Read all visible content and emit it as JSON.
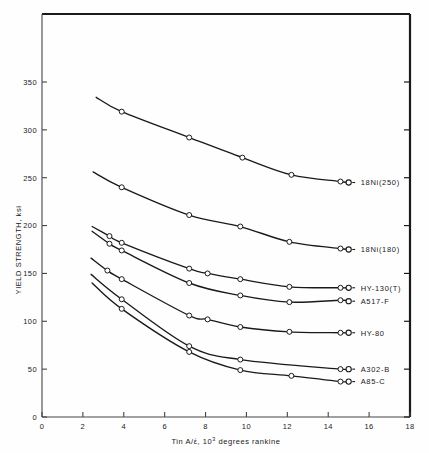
{
  "chart_data": {
    "type": "line",
    "title": "",
    "xlabel": "Tin A/έ, 10³ degrees rankine",
    "ylabel": "YIELD STRENGTH, ksi",
    "xlim": [
      0,
      18
    ],
    "ylim": [
      0,
      375
    ],
    "xticks": [
      0,
      2,
      4,
      6,
      8,
      10,
      12,
      14,
      16,
      18
    ],
    "yticks": [
      0,
      50,
      100,
      150,
      200,
      250,
      300,
      350
    ],
    "xtick_labels": [
      "0",
      "2",
      "4",
      "6",
      "8",
      "10",
      "12",
      "14",
      "16",
      "18"
    ],
    "ytick_labels": [
      "0",
      "50",
      "100",
      "150",
      "200",
      "250",
      "300",
      "350"
    ],
    "grid": false,
    "legend_position": "right-of-curve-ends",
    "marker": "open-circle",
    "line_color": "#1a1a1a",
    "series": [
      {
        "name": "18Ni(250)",
        "label": "18Ni(250)",
        "label_x": 15.6,
        "label_y": 246,
        "curve_start": [
          2.65,
          334
        ],
        "curve_end": [
          15.0,
          245
        ],
        "x": [
          3.9,
          7.2,
          9.8,
          12.2,
          14.6
        ],
        "values": [
          319,
          292,
          271,
          253,
          246
        ]
      },
      {
        "name": "18Ni(180)",
        "label": "18Ni(180)",
        "label_x": 15.6,
        "label_y": 176,
        "curve_start": [
          2.5,
          256
        ],
        "curve_end": [
          15.0,
          175
        ],
        "x": [
          3.9,
          7.2,
          9.7,
          12.1,
          14.6
        ],
        "values": [
          240,
          211,
          199,
          183,
          176
        ]
      },
      {
        "name": "HY-130(T)",
        "label": "HY-130(T)",
        "label_x": 15.6,
        "label_y": 135,
        "curve_start": [
          2.45,
          199
        ],
        "curve_end": [
          15.0,
          135
        ],
        "x": [
          3.3,
          3.9,
          7.2,
          8.1,
          9.7,
          12.1,
          14.6
        ],
        "values": [
          189,
          182,
          155,
          150,
          144,
          136,
          135
        ]
      },
      {
        "name": "A517-F",
        "label": "A517-F",
        "label_x": 15.6,
        "label_y": 121,
        "curve_start": [
          2.45,
          194
        ],
        "curve_end": [
          15.0,
          121
        ],
        "x": [
          3.3,
          3.9,
          7.2,
          9.7,
          12.1,
          14.6
        ],
        "values": [
          181,
          174,
          140,
          127,
          120,
          122
        ]
      },
      {
        "name": "HY-80",
        "label": "HY-80",
        "label_x": 15.6,
        "label_y": 88,
        "curve_start": [
          2.4,
          166
        ],
        "curve_end": [
          15.0,
          88
        ],
        "x": [
          3.2,
          3.9,
          7.2,
          8.1,
          9.7,
          12.1,
          14.6
        ],
        "values": [
          153,
          144,
          106,
          102,
          94,
          89,
          88
        ]
      },
      {
        "name": "A302-B",
        "label": "A302-B",
        "label_x": 15.6,
        "label_y": 50,
        "curve_start": [
          2.4,
          149
        ],
        "curve_end": [
          15.0,
          50
        ],
        "x": [
          3.9,
          7.2,
          9.7,
          14.6
        ],
        "values": [
          123,
          74,
          60,
          50
        ]
      },
      {
        "name": "A85-C",
        "label": "A85-C",
        "label_x": 15.6,
        "label_y": 37,
        "curve_start": [
          2.45,
          140
        ],
        "curve_end": [
          15.0,
          37
        ],
        "x": [
          3.9,
          7.2,
          9.7,
          12.2,
          14.6
        ],
        "values": [
          113,
          68,
          49,
          43,
          37
        ]
      }
    ]
  },
  "axis": {
    "x_title_main": "Tin A/έ, 10",
    "x_title_sup": "3",
    "x_title_tail": " degrees rankine",
    "y_title": "YIELD STRENGTH, ksi"
  }
}
